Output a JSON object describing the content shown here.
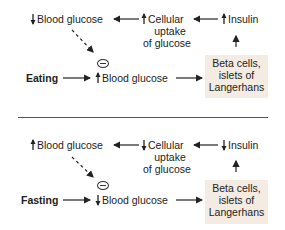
{
  "panels": [
    {
      "name": "eating",
      "trigger": "Eating",
      "blood_glucose_result": {
        "direction": "down",
        "label": "Blood glucose"
      },
      "cellular_uptake": {
        "direction": "up",
        "lines": [
          "Cellular",
          "uptake",
          "of glucose"
        ]
      },
      "insulin": {
        "direction": "up",
        "label": "Insulin"
      },
      "blood_glucose_input": {
        "direction": "up",
        "label": "Blood glucose"
      },
      "beta_cells": {
        "lines": [
          "Beta cells,",
          "islets of",
          "Langerhans"
        ]
      },
      "feedback_symbol": "inhibition"
    },
    {
      "name": "fasting",
      "trigger": "Fasting",
      "blood_glucose_result": {
        "direction": "up",
        "label": "Blood glucose"
      },
      "cellular_uptake": {
        "direction": "down",
        "lines": [
          "Cellular",
          "uptake",
          "of glucose"
        ]
      },
      "insulin": {
        "direction": "down",
        "label": "Insulin"
      },
      "blood_glucose_input": {
        "direction": "down",
        "label": "Blood glucose"
      },
      "beta_cells": {
        "lines": [
          "Beta cells,",
          "islets of",
          "Langerhans"
        ]
      },
      "feedback_symbol": "inhibition"
    }
  ],
  "colors": {
    "box_fill": "#f4ece2",
    "text": "#222222",
    "line": "#333333"
  }
}
